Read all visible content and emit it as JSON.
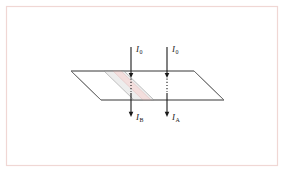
{
  "figure": {
    "frame": {
      "color": "#f0d7d4",
      "x": 6,
      "y": 6,
      "width": 271,
      "height": 159
    },
    "background_color": "#ffffff"
  },
  "plane": {
    "name": "horizontal-plane",
    "stroke_color": "#6f6f6f",
    "fill_color": "#ffffff",
    "points": "71,71 194,71 224,100 101,100"
  },
  "slab": {
    "name": "shaded-slab",
    "outer_fill": "#ededed",
    "outer_stroke": "#a8a8a8",
    "inner_fill": "#f3dedd",
    "inner_stroke": "#e4c3c1",
    "outer_points": "104,71 124,71 154,100 134,100",
    "inner_points": "113,71 121,71 151,100 143,100"
  },
  "beams": [
    {
      "id": "beam-b",
      "name": "beam-through-slab",
      "x": 131,
      "top_y": 47,
      "plane_entry_y": 78,
      "plane_exit_y": 92,
      "bottom_y": 117,
      "incident_label": "I",
      "incident_subscript": "0",
      "emergent_label": "I",
      "emergent_subscript": "B",
      "incident_label_x": 136,
      "incident_label_y": 52,
      "emergent_label_x": 136,
      "emergent_label_y": 120
    },
    {
      "id": "beam-a",
      "name": "beam-through-clear-region",
      "x": 167,
      "top_y": 47,
      "plane_entry_y": 78,
      "plane_exit_y": 92,
      "bottom_y": 117,
      "incident_label": "I",
      "incident_subscript": "0",
      "emergent_label": "I",
      "emergent_subscript": "A",
      "incident_label_x": 172,
      "incident_label_y": 52,
      "emergent_label_x": 172,
      "emergent_label_y": 120
    }
  ],
  "style": {
    "arrow_color": "#1a1a1a",
    "arrow_width": 1.1,
    "dotted_dash": "1.2,2.0"
  }
}
